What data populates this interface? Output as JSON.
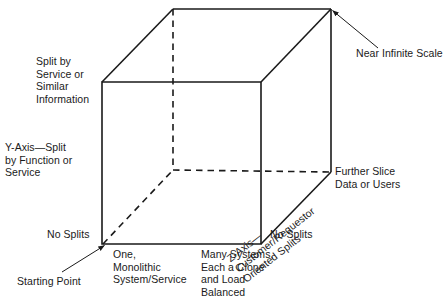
{
  "diagram": {
    "type": "three-axis-cube",
    "stroke_color": "#1a1a1a",
    "background_color": "#ffffff",
    "labels": {
      "y_top": "Split by\nService or\nSimilar\nInformation",
      "y_axis": "Y-Axis—Split\nby Function or\nService",
      "no_splits_left": "No Splits",
      "starting_point": "Starting Point",
      "x_one": "One,\nMonolithic\nSystem/Service",
      "x_many": "Many Systems,\nEach a Clone\nand Load\nBalanced",
      "no_splits_right": "No Splits",
      "near_infinite": "Near Infinite Scale",
      "further_slice": "Further Slice\nData or Users",
      "z_axis": "Z-Axis—Customer/Requestor\nOriented Splits"
    },
    "geometry": {
      "front_face": [
        [
          102,
          82
        ],
        [
          261,
          82
        ],
        [
          261,
          244
        ],
        [
          102,
          244
        ]
      ],
      "back_face": [
        [
          173,
          9
        ],
        [
          331,
          9
        ],
        [
          331,
          172
        ],
        [
          173,
          170
        ]
      ],
      "hidden_vertex": [
        173,
        170
      ],
      "leader_near_infinite": [
        [
          331,
          10
        ],
        [
          378,
          48
        ]
      ],
      "leader_starting_point": [
        [
          103,
          244
        ],
        [
          62,
          272
        ]
      ]
    }
  }
}
